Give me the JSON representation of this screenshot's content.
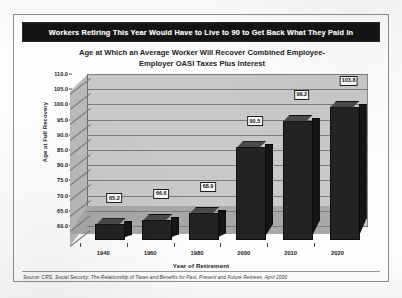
{
  "banner": {
    "headline": "Workers Retiring This Year Would Have to Live to 90 to Get Back What They Paid In"
  },
  "chart_data": {
    "type": "bar",
    "title_line1": "Age at Which an Average Worker Will Recover Combined Employee-",
    "title_line2": "Employer OASI Taxes Plus Interest",
    "xlabel": "Year of Retirement",
    "ylabel": "Age at Full Recovery",
    "categories": [
      "1940",
      "1960",
      "1980",
      "2000",
      "2010",
      "2020"
    ],
    "values": [
      65.2,
      66.6,
      68.9,
      90.5,
      99.2,
      103.8
    ],
    "data_labels": [
      "65.2",
      "66.6",
      "68.9",
      "90.5",
      "99.2",
      "103.8"
    ],
    "ylim": [
      60.0,
      110.0
    ],
    "ytick_labels": [
      "110.0",
      "105.0",
      "100.0",
      "95.0",
      "90.0",
      "85.0",
      "80.0",
      "75.0",
      "70.0",
      "65.0",
      "60.0"
    ],
    "ytick_values": [
      110.0,
      105.0,
      100.0,
      95.0,
      90.0,
      85.0,
      80.0,
      75.0,
      70.0,
      65.0,
      60.0
    ],
    "ytick_step": 5.0,
    "grid": true,
    "legend": "none",
    "style": "3d-column",
    "colors": {
      "bar_front": "#232323",
      "bar_top": "#4a4a4a",
      "bar_side": "#151515",
      "back_wall": "#c9c9c9",
      "side_wall": "#b9b9b9",
      "floor": "#a8a8a8",
      "gridline": "#7c7c7c",
      "banner_background": "#141414",
      "banner_text": "#ffffff"
    }
  },
  "source": {
    "note": "Source: CRS, Social Security: The Relationship of Taxes and Benefits for Past, Present and Future Retirees, April 2000"
  }
}
